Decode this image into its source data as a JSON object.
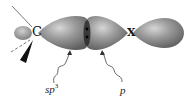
{
  "diagram": {
    "atoms": {
      "carbon": "C",
      "substituent": "X"
    },
    "labels": {
      "sp3_base": "sp",
      "sp3_exp": "3",
      "p": "p"
    },
    "colors": {
      "lobe_fill": "#8c8c8c",
      "lobe_highlight": "#c8c8c8",
      "lobe_shadow": "#5a5a5a",
      "wedge": "#111111",
      "bond_line": "#555555",
      "node": "#1a1a1a"
    }
  }
}
